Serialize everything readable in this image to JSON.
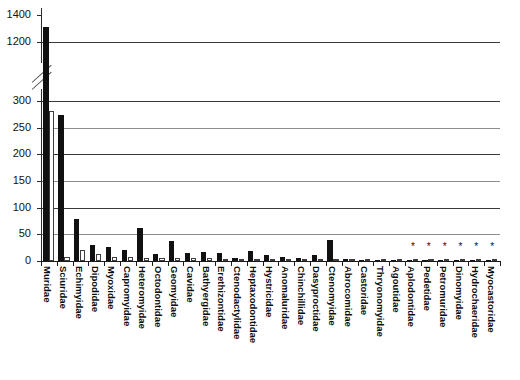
{
  "chart_data": {
    "type": "bar",
    "title": "",
    "subtitle": "",
    "xlabel": "",
    "ylabel": "",
    "grid": true,
    "legend_position": "none",
    "axis_break": {
      "present": true,
      "lower_max": 300,
      "upper_min": 1150,
      "note": "broken y-axis between 300 and 1150"
    },
    "ylim": [
      0,
      1400
    ],
    "yticks": [
      0,
      50,
      100,
      150,
      200,
      250,
      300,
      1200,
      1400
    ],
    "ytick_labels": [
      "0",
      "50",
      "100",
      "150",
      "200",
      "250",
      "300",
      "1200",
      "1400"
    ],
    "categories": [
      "Muridae",
      "Sciuridae",
      "Echimyidae",
      "Dipodidae",
      "Myoxidae",
      "Capromyidae",
      "Heteromyidae",
      "Octodontidae",
      "Geomyidae",
      "Cavidae",
      "Bathyergidae",
      "Erethizontidae",
      "Ctenodactylidae",
      "Heptaxodontidae",
      "Hystricidae",
      "Anomaluridae",
      "Chinchillidae",
      "Dasyproctidae",
      "Ctenomyidae",
      "Abrocomidae",
      "Castoridae",
      "Thryonomyidae",
      "Agoutidae",
      "Aplodontidae",
      "Pedetidae",
      "Petromuridae",
      "Dinomyidae",
      "Hydrochaeridae",
      "Myocastoridae"
    ],
    "series": [
      {
        "name": "species",
        "style": "filled",
        "values": [
          1310,
          273,
          78,
          30,
          26,
          20,
          62,
          13,
          38,
          15,
          16,
          15,
          5,
          19,
          11,
          7,
          6,
          11,
          40,
          3,
          2,
          2,
          2,
          1,
          1,
          1,
          1,
          1,
          1
        ]
      },
      {
        "name": "genera",
        "style": "open",
        "values": [
          281,
          7,
          20,
          14,
          8,
          8,
          6,
          5,
          6,
          5,
          5,
          4,
          4,
          4,
          3,
          2,
          3,
          2,
          1,
          2,
          1,
          1,
          1,
          1,
          1,
          1,
          1,
          1,
          1
        ]
      }
    ],
    "annotations": {
      "asterisk_symbol": "*",
      "asterisk_categories": [
        "Pedetidae",
        "Petromuridae",
        "Dinomyidae",
        "Hydrochaeridae",
        "Myocastoridae",
        "Aplodontidae"
      ]
    },
    "colors": {
      "filled_bar": "#111111",
      "open_bar_fill": "#ffffff",
      "open_bar_stroke": "#3d3d3d",
      "gridline": "#3a3a3a",
      "axis": "#1b1b1b",
      "text": "#0d0d0d",
      "background": "#ffffff"
    }
  }
}
